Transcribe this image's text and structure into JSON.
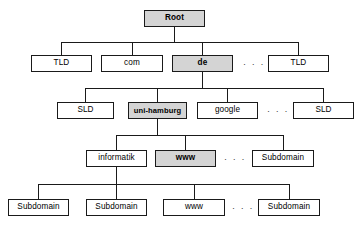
{
  "diagram": {
    "type": "tree",
    "canvas": {
      "width": 361,
      "height": 227,
      "background": "#ffffff"
    },
    "colors": {
      "line": "#1a1a1a",
      "node_fill": "#ffffff",
      "highlight_fill": "#d4d4d4",
      "text": "#000000"
    },
    "ellipsis": "· · ·",
    "levels": [
      {
        "name": "root",
        "y": 10
      },
      {
        "name": "top-level-domain",
        "y": 55
      },
      {
        "name": "second-level-domain",
        "y": 102
      },
      {
        "name": "subdomain-level-1",
        "y": 150
      },
      {
        "name": "subdomain-level-2",
        "y": 199
      }
    ],
    "nodes": [
      {
        "id": "root",
        "label": "Root",
        "level": 0,
        "x": 144,
        "y": 10,
        "w": 61,
        "h": 17,
        "highlight": true
      },
      {
        "id": "tld-left",
        "label": "TLD",
        "level": 1,
        "x": 31,
        "y": 55,
        "w": 61,
        "h": 17,
        "highlight": false
      },
      {
        "id": "com",
        "label": "com",
        "level": 1,
        "x": 101,
        "y": 55,
        "w": 62,
        "h": 17,
        "highlight": false
      },
      {
        "id": "de",
        "label": "de",
        "level": 1,
        "x": 172,
        "y": 55,
        "w": 61,
        "h": 17,
        "highlight": true
      },
      {
        "id": "tld-right",
        "label": "TLD",
        "level": 1,
        "x": 268,
        "y": 55,
        "w": 61,
        "h": 17,
        "highlight": false
      },
      {
        "id": "sld-left",
        "label": "SLD",
        "level": 2,
        "x": 57,
        "y": 102,
        "w": 57,
        "h": 17,
        "highlight": false
      },
      {
        "id": "uni-hamburg",
        "label": "uni-hamburg",
        "level": 2,
        "x": 128,
        "y": 102,
        "w": 59,
        "h": 17,
        "highlight": true
      },
      {
        "id": "google",
        "label": "google",
        "level": 2,
        "x": 197,
        "y": 102,
        "w": 61,
        "h": 17,
        "highlight": false
      },
      {
        "id": "sld-right",
        "label": "SLD",
        "level": 2,
        "x": 293,
        "y": 102,
        "w": 61,
        "h": 17,
        "highlight": false
      },
      {
        "id": "informatik",
        "label": "informatik",
        "level": 3,
        "x": 86,
        "y": 150,
        "w": 61,
        "h": 17,
        "highlight": false
      },
      {
        "id": "www-l3",
        "label": "www",
        "level": 3,
        "x": 155,
        "y": 150,
        "w": 61,
        "h": 17,
        "highlight": true
      },
      {
        "id": "sub-l3",
        "label": "Subdomain",
        "level": 3,
        "x": 252,
        "y": 150,
        "w": 62,
        "h": 17,
        "highlight": false
      },
      {
        "id": "sub-l4-a",
        "label": "Subdomain",
        "level": 4,
        "x": 8,
        "y": 199,
        "w": 61,
        "h": 17,
        "highlight": false
      },
      {
        "id": "sub-l4-b",
        "label": "Subdomain",
        "level": 4,
        "x": 86,
        "y": 199,
        "w": 61,
        "h": 17,
        "highlight": false
      },
      {
        "id": "www-l4",
        "label": "www",
        "level": 4,
        "x": 163,
        "y": 199,
        "w": 62,
        "h": 17,
        "highlight": false
      },
      {
        "id": "sub-l4-d",
        "label": "Subdomain",
        "level": 4,
        "x": 258,
        "y": 199,
        "w": 62,
        "h": 17,
        "highlight": false
      }
    ],
    "ellipses": [
      {
        "id": "ellipsis-tld",
        "x": 243,
        "y": 60
      },
      {
        "id": "ellipsis-sld",
        "x": 267,
        "y": 107
      },
      {
        "id": "ellipsis-sub1",
        "x": 224,
        "y": 155
      },
      {
        "id": "ellipsis-sub2",
        "x": 232,
        "y": 204
      }
    ]
  }
}
